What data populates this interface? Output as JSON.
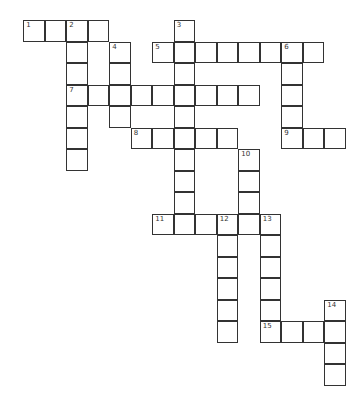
{
  "puzzle": {
    "type": "crossword",
    "origin": {
      "x": 24,
      "y": 21
    },
    "cell_size": 21.5,
    "words": [
      {
        "number": "1",
        "direction": "across",
        "row": 0,
        "col": 0,
        "length": 4
      },
      {
        "number": "2",
        "direction": "down",
        "row": 0,
        "col": 2,
        "length": 7
      },
      {
        "number": "3",
        "direction": "down",
        "row": 0,
        "col": 7,
        "length": 10
      },
      {
        "number": "4",
        "direction": "down",
        "row": 1,
        "col": 4,
        "length": 4
      },
      {
        "number": "5",
        "direction": "across",
        "row": 1,
        "col": 6,
        "length": 8
      },
      {
        "number": "6",
        "direction": "down",
        "row": 1,
        "col": 12,
        "length": 5
      },
      {
        "number": "7",
        "direction": "across",
        "row": 3,
        "col": 2,
        "length": 9
      },
      {
        "number": "8",
        "direction": "across",
        "row": 5,
        "col": 5,
        "length": 5
      },
      {
        "number": "9",
        "direction": "across",
        "row": 5,
        "col": 12,
        "length": 3
      },
      {
        "number": "10",
        "direction": "down",
        "row": 6,
        "col": 10,
        "length": 4
      },
      {
        "number": "11",
        "direction": "across",
        "row": 9,
        "col": 6,
        "length": 6
      },
      {
        "number": "12",
        "direction": "down",
        "row": 9,
        "col": 9,
        "length": 6
      },
      {
        "number": "13",
        "direction": "down",
        "row": 9,
        "col": 11,
        "length": 6
      },
      {
        "number": "14",
        "direction": "down",
        "row": 13,
        "col": 14,
        "length": 4
      },
      {
        "number": "15",
        "direction": "across",
        "row": 14,
        "col": 11,
        "length": 4
      }
    ]
  }
}
